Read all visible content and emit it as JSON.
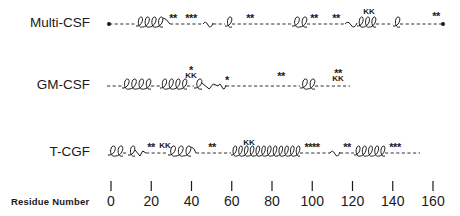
{
  "figure": {
    "type": "protein-secondary-structure-comparison",
    "axis": {
      "title": "Residue Number",
      "ticks": [
        0,
        20,
        40,
        60,
        80,
        100,
        120,
        140,
        160
      ],
      "tick_labels": [
        "0",
        "20",
        "40",
        "60",
        "80",
        "100",
        "120",
        "140",
        "160"
      ],
      "px_origin": 111,
      "px_per_residue": 2.0125
    },
    "legend_symbols": {
      "helix": "coil",
      "loop": "dashed line",
      "turn": "wavy line",
      "asterisk": "*",
      "basic_pair": "KK"
    },
    "rows": [
      {
        "name": "Multi-CSF",
        "label_top": 15,
        "y": 24,
        "segments": [
          {
            "type": "dot",
            "x": 109
          },
          {
            "type": "dash",
            "x1": 109,
            "x2": 136
          },
          {
            "type": "helix",
            "x1": 136,
            "x2": 163,
            "loops": 4
          },
          {
            "type": "tail",
            "x1": 163,
            "x2": 170
          },
          {
            "type": "dash",
            "x1": 170,
            "x2": 203
          },
          {
            "type": "wave",
            "x1": 203,
            "x2": 213
          },
          {
            "type": "dash",
            "x1": 213,
            "x2": 225
          },
          {
            "type": "helix",
            "x1": 225,
            "x2": 232,
            "loops": 1
          },
          {
            "type": "dash",
            "x1": 232,
            "x2": 292
          },
          {
            "type": "helix",
            "x1": 292,
            "x2": 307,
            "loops": 2
          },
          {
            "type": "dash",
            "x1": 307,
            "x2": 345
          },
          {
            "type": "wave",
            "x1": 345,
            "x2": 357
          },
          {
            "type": "helix",
            "x1": 357,
            "x2": 376,
            "loops": 3
          },
          {
            "type": "dash",
            "x1": 376,
            "x2": 393
          },
          {
            "type": "helix",
            "x1": 393,
            "x2": 400,
            "loops": 1
          },
          {
            "type": "dash",
            "x1": 400,
            "x2": 443
          },
          {
            "type": "dot",
            "x": 443
          }
        ],
        "marks": [
          {
            "text": "**",
            "x": 173,
            "y": 18
          },
          {
            "text": "***",
            "x": 191,
            "y": 18
          },
          {
            "text": "**",
            "x": 250,
            "y": 18
          },
          {
            "text": "**",
            "x": 314,
            "y": 18
          },
          {
            "text": "**",
            "x": 336,
            "y": 18
          },
          {
            "text": "KK",
            "x": 369,
            "y": 14,
            "kind": "kk"
          },
          {
            "text": "**",
            "x": 436,
            "y": 16
          }
        ]
      },
      {
        "name": "GM-CSF",
        "label_top": 77,
        "y": 86,
        "segments": [
          {
            "type": "dash",
            "x1": 107,
            "x2": 122
          },
          {
            "type": "helix",
            "x1": 122,
            "x2": 151,
            "loops": 4
          },
          {
            "type": "dash",
            "x1": 151,
            "x2": 160
          },
          {
            "type": "helix",
            "x1": 160,
            "x2": 187,
            "loops": 4
          },
          {
            "type": "dash",
            "x1": 187,
            "x2": 194
          },
          {
            "type": "helix",
            "x1": 194,
            "x2": 202,
            "loops": 1
          },
          {
            "type": "vee",
            "x1": 202,
            "x2": 218
          },
          {
            "type": "wave",
            "x1": 218,
            "x2": 226
          },
          {
            "type": "dash",
            "x1": 226,
            "x2": 300
          },
          {
            "type": "helix",
            "x1": 300,
            "x2": 315,
            "loops": 2
          },
          {
            "type": "dash",
            "x1": 315,
            "x2": 350
          }
        ],
        "marks": [
          {
            "text": "*",
            "x": 191,
            "y": 70
          },
          {
            "text": "KK",
            "x": 191,
            "y": 78,
            "kind": "kk"
          },
          {
            "text": "*",
            "x": 227,
            "y": 80
          },
          {
            "text": "**",
            "x": 281,
            "y": 76
          },
          {
            "text": "**",
            "x": 338,
            "y": 73
          },
          {
            "text": "KK",
            "x": 338,
            "y": 81,
            "kind": "kk"
          }
        ]
      },
      {
        "name": "T-CGF",
        "label_top": 144,
        "y": 153,
        "segments": [
          {
            "type": "helix",
            "x1": 108,
            "x2": 123,
            "loops": 2
          },
          {
            "type": "dash",
            "x1": 123,
            "x2": 128
          },
          {
            "type": "helix",
            "x1": 128,
            "x2": 135,
            "loops": 1
          },
          {
            "type": "vee",
            "x1": 135,
            "x2": 146
          },
          {
            "type": "dash",
            "x1": 146,
            "x2": 168
          },
          {
            "type": "helix",
            "x1": 168,
            "x2": 191,
            "loops": 3
          },
          {
            "type": "tail",
            "x1": 191,
            "x2": 196
          },
          {
            "type": "dash",
            "x1": 196,
            "x2": 231
          },
          {
            "type": "helix",
            "x1": 231,
            "x2": 300,
            "loops": 12
          },
          {
            "type": "dash",
            "x1": 300,
            "x2": 330
          },
          {
            "type": "wave",
            "x1": 330,
            "x2": 340
          },
          {
            "type": "dash",
            "x1": 340,
            "x2": 354
          },
          {
            "type": "helix",
            "x1": 354,
            "x2": 385,
            "loops": 5
          },
          {
            "type": "dash",
            "x1": 385,
            "x2": 420
          }
        ],
        "marks": [
          {
            "text": "**",
            "x": 151,
            "y": 147
          },
          {
            "text": "KK",
            "x": 165,
            "y": 148,
            "kind": "kk"
          },
          {
            "text": "**",
            "x": 212,
            "y": 147
          },
          {
            "text": "KK",
            "x": 249,
            "y": 145,
            "kind": "kk"
          },
          {
            "text": "****",
            "x": 312,
            "y": 147
          },
          {
            "text": "**",
            "x": 347,
            "y": 147
          },
          {
            "text": "***",
            "x": 395,
            "y": 147
          }
        ]
      }
    ]
  },
  "colors": {
    "ink": "#1a1a1a",
    "background": "#ffffff"
  }
}
